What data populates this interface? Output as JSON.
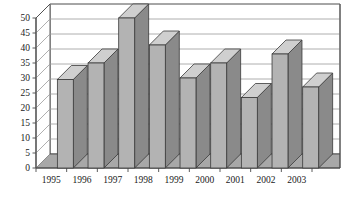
{
  "chart_data": {
    "type": "bar",
    "title": "",
    "subtitle": "",
    "xlabel": "",
    "ylabel": "",
    "categories": [
      "1995",
      "1996",
      "1997",
      "1998",
      "1999",
      "2000",
      "2001",
      "2002",
      "2003"
    ],
    "values": [
      29.5,
      35,
      50,
      41,
      30,
      35,
      23.5,
      38,
      27
    ],
    "series": [
      {
        "name": "Series 1",
        "values": [
          29.5,
          35,
          50,
          41,
          30,
          35,
          23.5,
          38,
          27
        ]
      }
    ],
    "ylim": [
      0,
      50
    ],
    "ytick_labels": [
      "0",
      "5",
      "10",
      "15",
      "20",
      "25",
      "30",
      "35",
      "40",
      "45",
      "50"
    ],
    "ytick_values": [
      0,
      5,
      10,
      15,
      20,
      25,
      30,
      35,
      40,
      45,
      50
    ],
    "ytick_step": 5,
    "grid": true,
    "grid_axis": "y",
    "legend": false,
    "legend_position": "none",
    "style": "3d-column",
    "colors": {
      "bar_front": "#b3b3b3",
      "bar_side": "#8a8a8a",
      "bar_top": "#cfcfcf",
      "bar_outline": "#3a3a3a",
      "grid_line": "#9a9a9a",
      "axis_line": "#4a4a4a",
      "floor": "#a8a8a8",
      "back_wall": "#ffffff",
      "text": "#1a1a1a",
      "background": "#ffffff"
    },
    "annotations": []
  }
}
